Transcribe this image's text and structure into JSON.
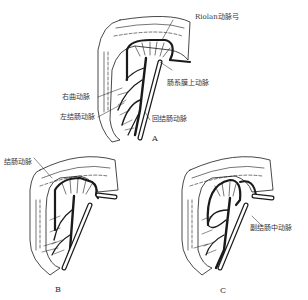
{
  "figure": {
    "panels": [
      {
        "id": "A",
        "letter": "A",
        "labels": {
          "riolan": "Riolan动脉弓",
          "sma": "肠系膜上动脉",
          "right_colic": "右曲动脉",
          "left_colic": "左结肠动脉",
          "ileocolic": "回结肠动脉"
        }
      },
      {
        "id": "B",
        "letter": "B",
        "labels": {
          "colic": "结肠动脉"
        }
      },
      {
        "id": "C",
        "letter": "C",
        "labels": {
          "accessory_middle_colic": "副结肠中动脉"
        }
      }
    ]
  },
  "colors": {
    "ink": "#1a1a1a",
    "background": "#ffffff"
  }
}
